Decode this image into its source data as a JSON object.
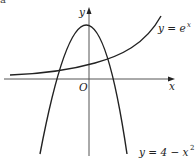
{
  "figure": {
    "corner_fragment": "a",
    "axes": {
      "x_label": "x",
      "y_label": "y",
      "origin_label": "O"
    },
    "curves": [
      {
        "name": "exponential",
        "label_lhs": "y = e",
        "label_sup": "x",
        "equation": "y = e^x"
      },
      {
        "name": "parabola",
        "label_lhs": "y = 4 − x",
        "label_sup": "2",
        "equation": "y = 4 - x^2"
      }
    ],
    "colors": {
      "curve": "#222222",
      "axis": "#555555",
      "background": "#ffffff"
    }
  }
}
